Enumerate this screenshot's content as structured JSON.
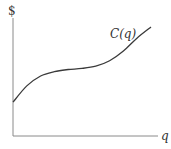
{
  "chart_data": {
    "type": "line",
    "title": "",
    "xlabel": "q",
    "ylabel": "$",
    "xlim": [
      0,
      10
    ],
    "ylim": [
      0,
      10
    ],
    "grid": false,
    "legend": "none",
    "annotations": [
      {
        "text": "C(q)",
        "near": "top-right of curve"
      }
    ],
    "series": [
      {
        "name": "C(q)",
        "x": [
          0,
          1,
          2,
          3,
          4,
          5,
          6,
          7,
          8,
          9,
          10
        ],
        "y": [
          3.1,
          4.6,
          5.5,
          5.9,
          6.1,
          6.2,
          6.4,
          6.9,
          7.8,
          9.0,
          10.0
        ]
      }
    ]
  }
}
